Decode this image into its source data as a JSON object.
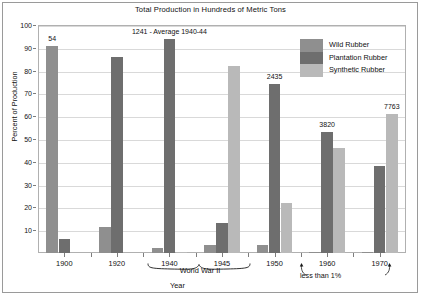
{
  "chart_data": {
    "type": "bar",
    "title": "Total Production in Hundreds of Metric Tons",
    "xlabel": "Year",
    "ylabel": "Percent of Production",
    "categories": [
      "1900",
      "1920",
      "1940",
      "1945",
      "1950",
      "1960",
      "1970"
    ],
    "ylim": [
      0,
      100
    ],
    "yticks": [
      0,
      10,
      20,
      30,
      40,
      50,
      60,
      70,
      80,
      90,
      100
    ],
    "ytick_labels": [
      "",
      "10",
      "20",
      "30",
      "40",
      "50",
      "60",
      "70",
      "80",
      "90",
      "100"
    ],
    "grid": true,
    "legend_position": "top-right",
    "series": [
      {
        "name": "Wild Rubber",
        "color": "#8f8f8f",
        "values": [
          91,
          11.5,
          2,
          3.5,
          3.5,
          0.6,
          0.6
        ]
      },
      {
        "name": "Plantation Rubber",
        "color": "#6e6e6e",
        "values": [
          6,
          86,
          94,
          13,
          74,
          53,
          38
        ]
      },
      {
        "name": "Synthetic Rubber",
        "color": "#b9b9b9",
        "values": [
          0,
          0,
          0.5,
          82,
          22,
          46,
          61
        ]
      }
    ],
    "point_labels": [
      {
        "category": "1900",
        "series": "Wild Rubber",
        "text": "54"
      },
      {
        "category": "1940",
        "series": "Plantation Rubber",
        "text": "1241 - Average 1940-44"
      },
      {
        "category": "1950",
        "series": "Plantation Rubber",
        "text": "2435"
      },
      {
        "category": "1960",
        "series": "Plantation Rubber",
        "text": "3820"
      },
      {
        "category": "1970",
        "series": "Synthetic Rubber",
        "text": "7763"
      }
    ],
    "annotations": [
      {
        "name": "world-war-2",
        "text": "World War II",
        "spans": [
          "1940",
          "1945"
        ]
      },
      {
        "name": "less-than-one-percent",
        "text": "less than 1%",
        "points_to": [
          "1960",
          "1970"
        ]
      }
    ]
  },
  "legend": {
    "items": [
      {
        "label": "Wild Rubber"
      },
      {
        "label": "Plantation Rubber"
      },
      {
        "label": "Synthetic Rubber"
      }
    ]
  }
}
